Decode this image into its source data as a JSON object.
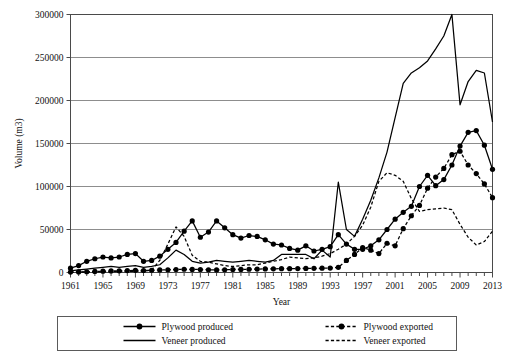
{
  "chart_data": {
    "type": "line",
    "title": "",
    "xlabel": "Year",
    "ylabel": "Volume (m3)",
    "xlim": [
      1961,
      2013
    ],
    "ylim": [
      0,
      300000
    ],
    "ytick_values": [
      0,
      50000,
      100000,
      150000,
      200000,
      250000,
      300000
    ],
    "ytick_labels": [
      "0",
      "50000",
      "100000",
      "150000",
      "200000",
      "250000",
      "300000"
    ],
    "xtick_labels": [
      "1961",
      "1965",
      "1969",
      "1973",
      "1977",
      "1981",
      "1985",
      "1989",
      "1993",
      "1997",
      "2001",
      "2005",
      "2009",
      "2013"
    ],
    "xtick_values": [
      1961,
      1965,
      1969,
      1973,
      1977,
      1981,
      1985,
      1989,
      1993,
      1997,
      2001,
      2005,
      2009,
      2013
    ],
    "xtick_step_minor": 1,
    "grid": "horizontal",
    "legend_position": "bottom",
    "x": [
      1961,
      1962,
      1963,
      1964,
      1965,
      1966,
      1967,
      1968,
      1969,
      1970,
      1971,
      1972,
      1973,
      1974,
      1975,
      1976,
      1977,
      1978,
      1979,
      1980,
      1981,
      1982,
      1983,
      1984,
      1985,
      1986,
      1987,
      1988,
      1989,
      1990,
      1991,
      1992,
      1993,
      1994,
      1995,
      1996,
      1997,
      1998,
      1999,
      2000,
      2001,
      2002,
      2003,
      2004,
      2005,
      2006,
      2007,
      2008,
      2009,
      2010,
      2011,
      2012,
      2013
    ],
    "series": [
      {
        "name": "Plywood produced",
        "style": "solid",
        "marker": "circle",
        "color": "#000000",
        "values": [
          5000,
          8000,
          13000,
          16000,
          18000,
          17000,
          18000,
          21000,
          22000,
          13000,
          14000,
          19000,
          27000,
          35000,
          48000,
          60000,
          41000,
          47000,
          60000,
          52000,
          44000,
          40000,
          43000,
          42000,
          38000,
          33000,
          32000,
          28000,
          26000,
          31000,
          25000,
          27000,
          30000,
          44000,
          33000,
          27000,
          27000,
          31000,
          38000,
          50000,
          62000,
          70000,
          77000,
          100000,
          113000,
          101000,
          108000,
          125000,
          147000,
          163000,
          165000,
          148000,
          120000
        ]
      },
      {
        "name": "Veneer produced",
        "style": "solid",
        "marker": "none",
        "color": "#000000",
        "values": [
          2000,
          3000,
          4000,
          5000,
          6000,
          7000,
          6000,
          7000,
          8000,
          6000,
          7000,
          9000,
          17000,
          26000,
          21000,
          13000,
          11000,
          12000,
          14000,
          13000,
          12000,
          13000,
          14000,
          13000,
          12000,
          14000,
          21000,
          21000,
          21000,
          21000,
          16000,
          26000,
          18000,
          105000,
          50000,
          42000,
          62000,
          84000,
          110000,
          140000,
          180000,
          220000,
          232000,
          238000,
          246000,
          260000,
          275000,
          300000,
          195000,
          222000,
          235000,
          232000,
          175000
        ]
      },
      {
        "name": "Plywood exported",
        "style": "dashed",
        "marker": "circle",
        "color": "#000000",
        "values": [
          500,
          700,
          900,
          1200,
          1500,
          1800,
          2000,
          2200,
          2500,
          2300,
          2600,
          3000,
          3200,
          3500,
          3800,
          3600,
          3500,
          3200,
          3000,
          3200,
          3500,
          3600,
          3800,
          4000,
          4200,
          4300,
          4400,
          4500,
          4600,
          4700,
          4800,
          5000,
          5200,
          6000,
          14000,
          21000,
          29000,
          26000,
          22000,
          34000,
          31000,
          51000,
          66000,
          78000,
          98000,
          111000,
          121000,
          137000,
          141000,
          125000,
          115000,
          103000,
          87000
        ]
      },
      {
        "name": "Veneer exported",
        "style": "dashed",
        "marker": "none",
        "color": "#000000",
        "values": [
          300,
          400,
          500,
          600,
          800,
          900,
          1000,
          1200,
          1300,
          1200,
          3000,
          14000,
          33000,
          53000,
          42000,
          20000,
          13000,
          12000,
          10000,
          8000,
          7000,
          8000,
          9000,
          9000,
          11000,
          13000,
          15000,
          18000,
          17000,
          16000,
          17000,
          19000,
          22000,
          27000,
          33000,
          42000,
          55000,
          76000,
          106000,
          116000,
          113000,
          106000,
          86000,
          71000,
          73000,
          74000,
          75000,
          73000,
          56000,
          41000,
          32000,
          36000,
          48000
        ]
      }
    ]
  },
  "legend": {
    "entries": [
      {
        "label": "Plywood produced",
        "style": "solid",
        "marker": "circle"
      },
      {
        "label": "Veneer produced",
        "style": "solid",
        "marker": "none"
      },
      {
        "label": "Plywood exported",
        "style": "dashed",
        "marker": "circle"
      },
      {
        "label": "Veneer exported",
        "style": "dashed",
        "marker": "none"
      }
    ]
  }
}
